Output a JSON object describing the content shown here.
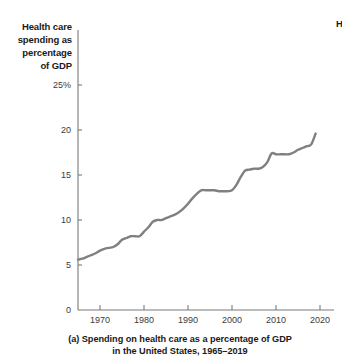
{
  "figure": {
    "caption_line1": "(a) Spending on health care as a percentage of GDP",
    "caption_line2": "in the United States, 1965–2019",
    "edge_partial_label": "H",
    "axis_title_lines": [
      "Health care",
      "spending as",
      "percentage",
      "of GDP"
    ],
    "line_color": "#808080",
    "axis_color": "#7a7a7a",
    "text_color": "#1a1a1a",
    "background": "#ffffff"
  },
  "chart_data": {
    "type": "line",
    "title": "(a) Spending on health care as a percentage of GDP in the United States, 1965–2019",
    "xlabel": "",
    "ylabel": "Health care spending as percentage of GDP",
    "xlim": [
      1965,
      2021
    ],
    "ylim": [
      0,
      26.5
    ],
    "grid": false,
    "legend": "none",
    "xticks": [
      1970,
      1980,
      1990,
      2000,
      2010,
      2020
    ],
    "xticklabels": [
      "1970",
      "1980",
      "1990",
      "2000",
      "2010",
      "2020"
    ],
    "yticks": [
      0,
      5,
      10,
      15,
      20,
      25
    ],
    "yticklabels": [
      "0",
      "5",
      "10",
      "15",
      "20",
      "25%"
    ],
    "series": [
      {
        "name": "Health care spending as percentage of GDP",
        "color": "#808080",
        "x": [
          1965,
          1966,
          1967,
          1968,
          1969,
          1970,
          1971,
          1972,
          1973,
          1974,
          1975,
          1976,
          1977,
          1978,
          1979,
          1980,
          1981,
          1982,
          1983,
          1984,
          1985,
          1986,
          1987,
          1988,
          1989,
          1990,
          1991,
          1992,
          1993,
          1994,
          1995,
          1996,
          1997,
          1998,
          1999,
          2000,
          2001,
          2002,
          2003,
          2004,
          2005,
          2006,
          2007,
          2008,
          2009,
          2010,
          2011,
          2012,
          2013,
          2014,
          2015,
          2016,
          2017,
          2018,
          2019
        ],
        "values": [
          5.6,
          5.7,
          5.9,
          6.1,
          6.3,
          6.6,
          6.8,
          6.9,
          7.0,
          7.3,
          7.8,
          8.0,
          8.2,
          8.2,
          8.2,
          8.7,
          9.2,
          9.8,
          10.0,
          10.0,
          10.2,
          10.4,
          10.6,
          10.9,
          11.3,
          11.8,
          12.4,
          12.9,
          13.3,
          13.3,
          13.3,
          13.3,
          13.2,
          13.2,
          13.2,
          13.3,
          13.9,
          14.8,
          15.5,
          15.6,
          15.7,
          15.7,
          15.9,
          16.4,
          17.4,
          17.3,
          17.3,
          17.3,
          17.3,
          17.5,
          17.8,
          18.0,
          18.2,
          18.4,
          19.6
        ]
      }
    ]
  }
}
